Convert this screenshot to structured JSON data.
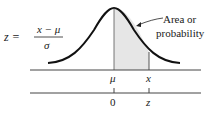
{
  "figure": {
    "type": "normal-distribution-diagram",
    "formula": {
      "lhs": "z =",
      "numerator": "x − μ",
      "denominator": "σ"
    },
    "annotation": {
      "line1": "Area or",
      "line2": "probability"
    },
    "axes": [
      {
        "name": "x-axis",
        "ticks": [
          {
            "label": "μ"
          },
          {
            "label": "x"
          }
        ]
      },
      {
        "name": "z-axis",
        "ticks": [
          {
            "label": "0"
          },
          {
            "label": "z"
          }
        ]
      }
    ],
    "colors": {
      "curve": "#111111",
      "shade": "#e6e6e6",
      "axis": "#444444",
      "text": "#1a1a1a"
    }
  }
}
